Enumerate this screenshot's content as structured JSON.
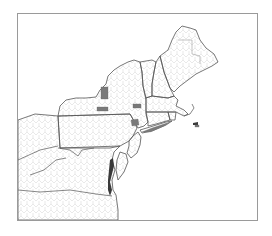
{
  "map": {
    "type": "choropleth",
    "region": "Northeastern United States (county level)",
    "frame": {
      "x": 17,
      "y": 13,
      "width": 241,
      "height": 208,
      "border_color": "#9a9a9a"
    },
    "colors": {
      "highlight": "#7a7a7a",
      "state_border": "#555555",
      "county_border": "#c8c8c8",
      "background": "#ffffff"
    },
    "states_shown": [
      "Maine",
      "New Hampshire",
      "Vermont",
      "Massachusetts",
      "Rhode Island",
      "Connecticut",
      "New York",
      "New Jersey",
      "Pennsylvania",
      "Delaware",
      "Maryland",
      "West Virginia",
      "Virginia",
      "Ohio (partial)",
      "Kentucky (partial)",
      "North Carolina (partial)"
    ],
    "highlighted_counties": [
      {
        "approx_location": "Central New York (west of Syracuse)",
        "x": 104,
        "y": 93
      },
      {
        "approx_location": "Southern tier New York",
        "x": 101,
        "y": 109
      },
      {
        "approx_location": "East-central New York",
        "x": 136,
        "y": 106
      },
      {
        "approx_location": "Hudson Valley New York",
        "x": 134,
        "y": 123
      },
      {
        "approx_location": "Long Island, New York",
        "x": 158,
        "y": 134
      },
      {
        "approx_location": "Nantucket / Massachusetts islands",
        "x": 196,
        "y": 126
      }
    ]
  }
}
